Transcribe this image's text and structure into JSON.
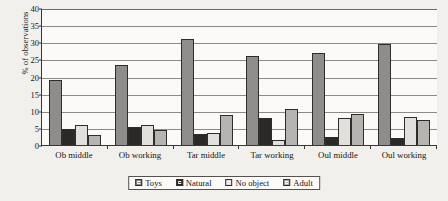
{
  "chart_data": {
    "type": "bar",
    "title": "",
    "xlabel": "",
    "ylabel": "% of observations",
    "ylim": [
      0,
      40
    ],
    "yticks": [
      0,
      5,
      10,
      15,
      20,
      25,
      30,
      35,
      40
    ],
    "grid": true,
    "legend_position": "bottom-center",
    "categories": [
      "Ob middle",
      "Ob working",
      "Tar middle",
      "Tar working",
      "Oul middle",
      "Oul working"
    ],
    "series": [
      {
        "name": "Toys",
        "color": "#8f8d8a",
        "values": [
          19.0,
          23.5,
          31.0,
          26.0,
          27.0,
          29.5
        ]
      },
      {
        "name": "Natural",
        "color": "#2b2927",
        "values": [
          4.6,
          5.4,
          3.3,
          8.0,
          2.4,
          2.0
        ]
      },
      {
        "name": "No object",
        "color": "#e2e0dc",
        "values": [
          5.8,
          5.8,
          3.6,
          1.5,
          8.0,
          8.3
        ]
      },
      {
        "name": "Adult",
        "color": "#b6b4b0",
        "values": [
          2.9,
          4.5,
          8.7,
          10.5,
          9.0,
          7.4
        ]
      }
    ]
  }
}
